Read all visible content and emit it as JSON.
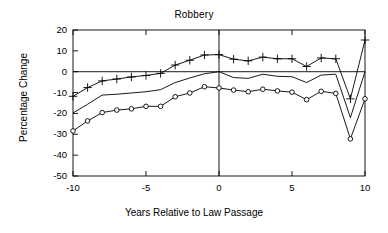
{
  "chart_data": {
    "type": "line",
    "title": "Robbery",
    "xlabel": "Years Relative to Law Passage",
    "ylabel": "Percentage Change",
    "x": [
      -10,
      -9,
      -8,
      -7,
      -6,
      -5,
      -4,
      -3,
      -2,
      -1,
      0,
      1,
      2,
      3,
      4,
      5,
      6,
      7,
      8,
      9,
      10
    ],
    "xlim": [
      -10,
      10
    ],
    "ylim": [
      -50,
      20
    ],
    "xticks": [
      -10,
      -5,
      0,
      5,
      10
    ],
    "xtick_labels": [
      "-10",
      "-5",
      "0",
      "5",
      "10"
    ],
    "yticks": [
      20,
      10,
      0,
      -10,
      -20,
      -30,
      -40,
      -50
    ],
    "ytick_labels": [
      "20",
      "10",
      "0",
      "-10",
      "-20",
      "-30",
      "-40",
      "-50"
    ],
    "grid": false,
    "legend": "none",
    "zero_line": 0,
    "vertical_reference_line": 0,
    "series": [
      {
        "name": "upper-confidence-bound",
        "marker": "plus",
        "values": [
          -11.8,
          -7.6,
          -4.4,
          -3.5,
          -2.5,
          -1.8,
          -0.8,
          3.2,
          5.5,
          8.0,
          8.2,
          6.0,
          5.2,
          7.0,
          6.2,
          6.2,
          2.5,
          6.6,
          6.2,
          -13.0,
          15.2
        ]
      },
      {
        "name": "point-estimate",
        "marker": "none",
        "values": [
          -19.8,
          -15.6,
          -11.2,
          -10.8,
          -10.2,
          -9.6,
          -8.6,
          -5.2,
          -3.0,
          -1.0,
          0.0,
          -2.8,
          -3.2,
          -1.2,
          -2.2,
          -2.4,
          -5.2,
          -1.6,
          -1.2,
          -22.0,
          0.0
        ]
      },
      {
        "name": "lower-confidence-bound",
        "marker": "circle",
        "values": [
          -28.4,
          -23.6,
          -19.6,
          -18.4,
          -17.8,
          -16.6,
          -16.6,
          -12.0,
          -10.2,
          -7.2,
          -7.8,
          -8.8,
          -9.6,
          -8.4,
          -9.2,
          -9.8,
          -13.4,
          -9.4,
          -10.4,
          -32.2,
          -13.0
        ]
      }
    ]
  },
  "axis": {
    "title": "Robbery",
    "ylabel": "Percentage Change",
    "xlabel": "Years Relative to Law Passage"
  }
}
